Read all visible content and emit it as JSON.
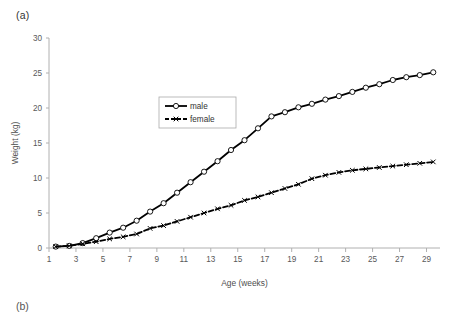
{
  "figure": {
    "panel_label": "(a)",
    "next_panel_label": "(b)"
  },
  "chart_data": {
    "type": "line",
    "title": "",
    "xlabel": "Age (weeks)",
    "ylabel": "Weight (kg)",
    "xlim": [
      1,
      30
    ],
    "ylim": [
      0,
      30
    ],
    "yticks": [
      0,
      5,
      10,
      15,
      20,
      25,
      30
    ],
    "ytick_labels": [
      "0",
      "5",
      "10",
      "15",
      "20",
      "25",
      "30"
    ],
    "xticks": [
      1,
      3,
      5,
      7,
      9,
      11,
      13,
      15,
      17,
      19,
      21,
      23,
      25,
      27,
      29
    ],
    "xtick_labels": [
      "1",
      "3",
      "5",
      "7",
      "9",
      "11",
      "13",
      "15",
      "17",
      "19",
      "21",
      "23",
      "25",
      "27",
      "29"
    ],
    "grid": false,
    "legend_position": "upper-center-left",
    "x": [
      1.5,
      2.5,
      3.5,
      4.5,
      5.5,
      6.5,
      7.5,
      8.5,
      9.5,
      10.5,
      11.5,
      12.5,
      13.5,
      14.5,
      15.5,
      16.5,
      17.5,
      18.5,
      19.5,
      20.5,
      21.5,
      22.5,
      23.5,
      24.5,
      25.5,
      26.5,
      27.5,
      28.5,
      29.5
    ],
    "series": [
      {
        "name": "male",
        "marker": "open-circle",
        "line_style": "solid",
        "color": "#000000",
        "values": [
          0.2,
          0.3,
          0.7,
          1.4,
          2.2,
          2.9,
          3.9,
          5.2,
          6.4,
          7.9,
          9.4,
          10.9,
          12.4,
          14.0,
          15.4,
          17.1,
          18.8,
          19.4,
          20.1,
          20.6,
          21.2,
          21.7,
          22.3,
          22.9,
          23.4,
          24.0,
          24.4,
          24.7,
          25.1
        ]
      },
      {
        "name": "female",
        "marker": "cross",
        "line_style": "dashed",
        "color": "#000000",
        "values": [
          0.2,
          0.3,
          0.6,
          0.9,
          1.3,
          1.6,
          2.0,
          2.8,
          3.2,
          3.8,
          4.4,
          5.0,
          5.6,
          6.1,
          6.8,
          7.3,
          7.9,
          8.5,
          9.1,
          9.9,
          10.4,
          10.8,
          11.1,
          11.3,
          11.5,
          11.7,
          11.9,
          12.1,
          12.3
        ]
      }
    ],
    "legend": [
      "male",
      "female"
    ]
  }
}
